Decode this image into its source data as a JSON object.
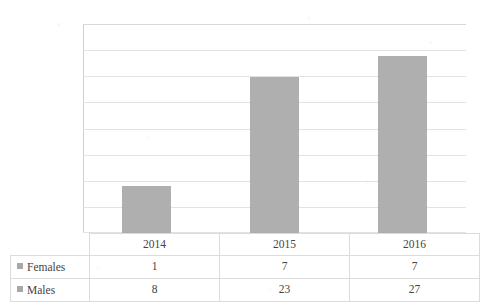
{
  "chart_data": {
    "type": "bar",
    "title": "",
    "xlabel": "",
    "ylabel": "",
    "categories": [
      "2014",
      "2015",
      "2016"
    ],
    "values": [
      9,
      30,
      34
    ],
    "ylim": [
      0,
      40
    ],
    "y_ticks": [
      40,
      35,
      30,
      25,
      20,
      15,
      10,
      5,
      0
    ],
    "grid": true,
    "legend_position": "table-left",
    "series": [
      {
        "name": "Females",
        "values": [
          1,
          7,
          7
        ]
      },
      {
        "name": "Males",
        "values": [
          8,
          23,
          27
        ]
      }
    ],
    "data_table": {
      "header": [
        "",
        "2014",
        "2015",
        "2016"
      ],
      "rows": [
        {
          "label": "Females",
          "cells": [
            "1",
            "7",
            "7"
          ]
        },
        {
          "label": "Males",
          "cells": [
            "8",
            "23",
            "27"
          ]
        }
      ]
    },
    "bar_color": "#a8a8a8",
    "gridline_color": "#e2e2e2",
    "note": "Bars show the total (Males + Females) per year."
  },
  "axis": {
    "t40": "40",
    "t35": "35",
    "t30": "30",
    "t25": "25",
    "t20": "20",
    "t15": "15",
    "t10": "10",
    "t5": "5",
    "t0": "0"
  },
  "table": {
    "year2014": "2014",
    "year2015": "2015",
    "year2016": "2016",
    "females_label": "Females",
    "males_label": "Males",
    "f2014": "1",
    "f2015": "7",
    "f2016": "7",
    "m2014": "8",
    "m2015": "23",
    "m2016": "27"
  }
}
